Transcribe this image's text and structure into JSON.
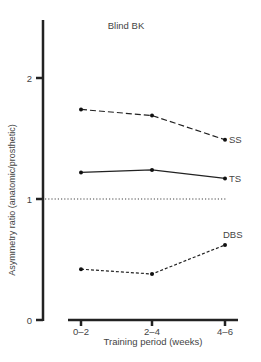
{
  "chart_data": {
    "type": "line",
    "title": "Blind BK",
    "xlabel": "Training period (weeks)",
    "ylabel": "Asymmetry  ratio (anatomic/prosthetic)",
    "categories": [
      "0–2",
      "2–4",
      "4–6"
    ],
    "ylim": [
      0,
      2.4
    ],
    "yticks": [
      0,
      1,
      2
    ],
    "grid": false,
    "legend_position": "inline-end-labels",
    "reference_line": {
      "y": 1,
      "style": "dotted"
    },
    "series": [
      {
        "name": "SS",
        "values": [
          1.74,
          1.69,
          1.49
        ],
        "line_style": "long-dash"
      },
      {
        "name": "TS",
        "values": [
          1.22,
          1.24,
          1.17
        ],
        "line_style": "solid"
      },
      {
        "name": "DBS",
        "values": [
          0.42,
          0.38,
          0.62
        ],
        "line_style": "short-dash"
      }
    ]
  }
}
